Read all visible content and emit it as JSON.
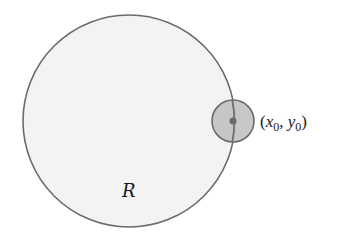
{
  "diagram": {
    "region": {
      "label": "R",
      "cx": 129,
      "cy": 121,
      "r": 106,
      "fill": "#f3f3f3",
      "stroke": "#6a6a6a"
    },
    "neighborhood": {
      "cx": 233,
      "cy": 121,
      "r": 21,
      "fill": "#bdbdbd",
      "stroke": "#6a6a6a"
    },
    "point": {
      "cx": 233,
      "cy": 121,
      "r": 3.5,
      "fill": "#6a6a6a",
      "label_open": "(",
      "x_var": "x",
      "x_sub": "0",
      "sep": ", ",
      "y_var": "y",
      "y_sub": "0",
      "label_close": ")"
    }
  }
}
